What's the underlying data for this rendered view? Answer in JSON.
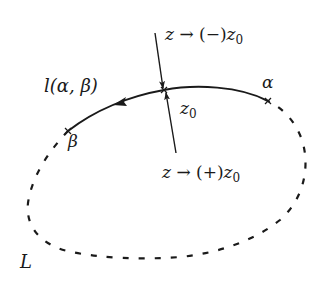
{
  "diagram": {
    "type": "contour-diagram",
    "labels": {
      "arc": "l(α, β)",
      "alpha": "α",
      "beta": "β",
      "z0": "z",
      "z0_sub": "0",
      "contour": "L",
      "minus_approach": {
        "z": "z",
        "arrow": "→",
        "sign": "(−)",
        "target": "z",
        "target_sub": "0"
      },
      "plus_approach": {
        "z": "z",
        "arrow": "→",
        "sign": "(+)",
        "target": "z",
        "target_sub": "0"
      }
    },
    "points": {
      "alpha": {
        "x": 268,
        "y": 101
      },
      "beta": {
        "x": 68,
        "y": 131
      },
      "z0": {
        "x": 164,
        "y": 90
      }
    },
    "colors": {
      "stroke": "#1a1a1a",
      "background": "#ffffff"
    }
  }
}
